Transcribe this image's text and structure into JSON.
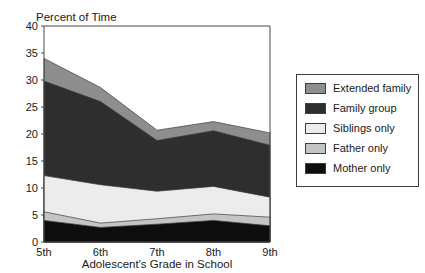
{
  "chart_data": {
    "type": "area",
    "stacked": true,
    "title": "Percent of Time",
    "xlabel": "Adolescent's Grade in School",
    "ylabel": "",
    "categories": [
      "5th",
      "6th",
      "7th",
      "8th",
      "9th"
    ],
    "ylim": [
      0,
      40
    ],
    "yticks": [
      0,
      5,
      10,
      15,
      20,
      25,
      30,
      35,
      40
    ],
    "ytick_labels": [
      "0",
      "5",
      "10",
      "15",
      "20",
      "25",
      "30",
      "35",
      "40"
    ],
    "xtick_labels": [
      "5th",
      "6th",
      "7th",
      "8th",
      "9th"
    ],
    "grid": false,
    "legend_position": "right",
    "series": [
      {
        "name": "Mother only",
        "color": "#0d0d0d",
        "values": [
          4.0,
          2.7,
          3.3,
          4.0,
          3.0
        ],
        "cumulative": [
          4.0,
          2.7,
          3.3,
          4.0,
          3.0
        ]
      },
      {
        "name": "Father only",
        "color": "#c4c4c4",
        "values": [
          1.6,
          0.8,
          1.0,
          1.2,
          1.6
        ],
        "cumulative": [
          5.6,
          3.5,
          4.3,
          5.2,
          4.6
        ]
      },
      {
        "name": "Siblings only",
        "color": "#ececec",
        "values": [
          6.7,
          7.1,
          5.1,
          5.1,
          3.7
        ],
        "cumulative": [
          12.3,
          10.6,
          9.4,
          10.3,
          8.3
        ]
      },
      {
        "name": "Family group",
        "color": "#2e2e2e",
        "values": [
          17.5,
          15.4,
          9.4,
          10.3,
          9.6
        ],
        "cumulative": [
          29.8,
          26.0,
          18.8,
          20.6,
          17.9
        ]
      },
      {
        "name": "Extended family",
        "color": "#8e8e8e",
        "values": [
          4.2,
          2.6,
          1.9,
          1.7,
          2.3
        ],
        "cumulative": [
          34.0,
          28.6,
          20.7,
          22.3,
          20.2
        ]
      }
    ]
  },
  "legend": {
    "items": [
      {
        "label": "Extended family",
        "color": "#8e8e8e"
      },
      {
        "label": "Family group",
        "color": "#2e2e2e"
      },
      {
        "label": "Siblings only",
        "color": "#ececec"
      },
      {
        "label": "Father only",
        "color": "#c4c4c4"
      },
      {
        "label": "Mother only",
        "color": "#0d0d0d"
      }
    ]
  }
}
